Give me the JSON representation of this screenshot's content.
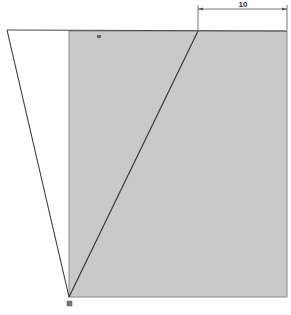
{
  "sketch": {
    "background": "#ffffff",
    "region_fill": "#c9c9c9",
    "line_color": "#3a3a3a",
    "rectangle": {
      "x": 69,
      "y": 31,
      "width": 218,
      "height": 266
    },
    "left_vertex": {
      "x": 7,
      "y": 30
    },
    "bottom_vertex": {
      "x": 69,
      "y": 297
    },
    "top_vertex": {
      "x": 198,
      "y": 31
    },
    "dimension": {
      "label": "10",
      "x1": 198,
      "x2": 287,
      "y": 8
    }
  }
}
